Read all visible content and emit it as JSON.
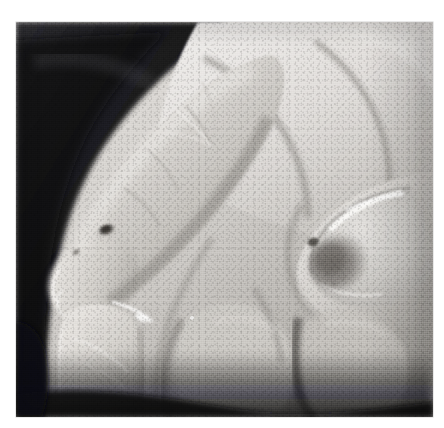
{
  "page": {
    "background_color": "#ffffff",
    "width": 444,
    "height": 428
  },
  "photograph": {
    "alt_text": "Black and white clinical close-up photograph of a human hand, palmar-lateral view, showing fingertips; a small dark pigmented lesion is present on the distal pad of the index finger and a dark discolored area is visible beneath the nail of the thumb.",
    "caption": "",
    "frame": {
      "left": 16,
      "top": 22,
      "width": 417,
      "height": 395,
      "border_color": "#b4b4b4"
    },
    "medium": "grayscale halftone print reproduction",
    "palette": {
      "paper_white": "#ffffff",
      "background_dark": "#16161a",
      "background_dark_2": "#2a2a2e",
      "shadow_deep": "#3a3a3c",
      "skin_highlight": "#e9e7e4",
      "skin_light": "#d6d3cf",
      "skin_mid": "#b8b5b1",
      "skin_shade": "#97948f",
      "crease_dark": "#6f6c68",
      "lesion_dark": "#4a4744",
      "nail_highlight": "#f2f0ee",
      "subungual_dark": "#6a6662"
    },
    "features": [
      {
        "id": "background-upper-left",
        "label": "Dark photographic background",
        "region": "upper-left corner"
      },
      {
        "id": "index-finger",
        "label": "Index finger, extended toward lower left",
        "region": "left-center"
      },
      {
        "id": "index-finger-lesion",
        "label": "Pigmented lesion on index fingertip pad",
        "region": "left-center",
        "appearance": "small dark irregular macule"
      },
      {
        "id": "middle-finger",
        "label": "Middle finger with flexion creases",
        "region": "upper-center"
      },
      {
        "id": "thumb",
        "label": "Thumb with nail plate",
        "region": "right-center"
      },
      {
        "id": "thumb-nail",
        "label": "Thumb nail plate with bright specular highlight",
        "region": "right-center"
      },
      {
        "id": "subungual-lesion",
        "label": "Dark subungual discoloration under thumb nail",
        "region": "right-center",
        "appearance": "grey-brown band / patch"
      },
      {
        "id": "ring-finger",
        "label": "Folded finger below index",
        "region": "lower-left"
      },
      {
        "id": "palm-creases",
        "label": "Palmar skin folds and interdigital shadows",
        "region": "center / lower-center"
      },
      {
        "id": "shadow-lower-edge",
        "label": "Deep shadow along the lower border",
        "region": "bottom"
      }
    ]
  }
}
